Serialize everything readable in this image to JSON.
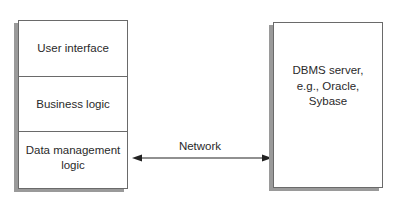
{
  "client": {
    "layers": [
      {
        "label": "User interface"
      },
      {
        "label": "Business logic"
      },
      {
        "label": "Data management logic"
      }
    ]
  },
  "server": {
    "label_lines": [
      "DBMS server,",
      "e.g., Oracle,",
      "Sybase"
    ]
  },
  "connection": {
    "label": "Network",
    "direction": "bidirectional"
  },
  "colors": {
    "border": "#6a6a6a",
    "shadow": "#9a9a9a",
    "text": "#2a2a2a",
    "arrow": "#222222"
  }
}
